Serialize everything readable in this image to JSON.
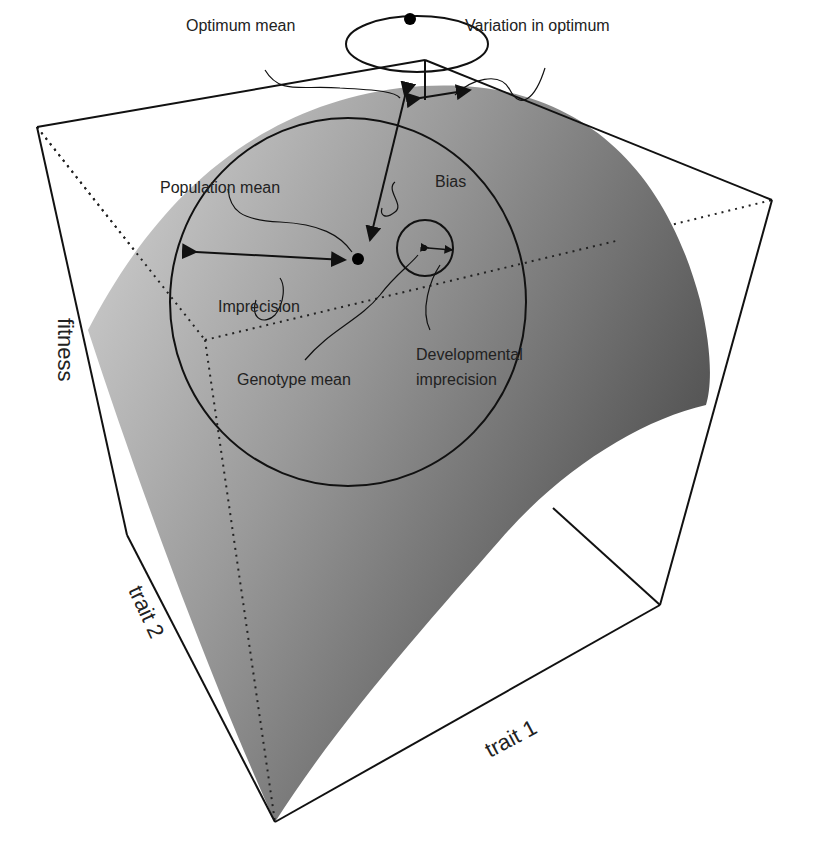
{
  "diagram": {
    "type": "3d-fitness-landscape",
    "axes": {
      "z_label": "fitness",
      "y_label": "trait 2",
      "x_label": "trait 1"
    },
    "annotations": {
      "optimum_mean": "Optimum mean",
      "variation_in_optimum": "Variation in optimum",
      "population_mean": "Population mean",
      "bias": "Bias",
      "imprecision": "Imprecision",
      "genotype_mean": "Genotype mean",
      "developmental_imprecision_line1": "Developmental",
      "developmental_imprecision_line2": "imprecision"
    },
    "colors": {
      "surface_light": "#c8c8c8",
      "surface_dark": "#4a4a4a",
      "lines": "#111111"
    }
  }
}
